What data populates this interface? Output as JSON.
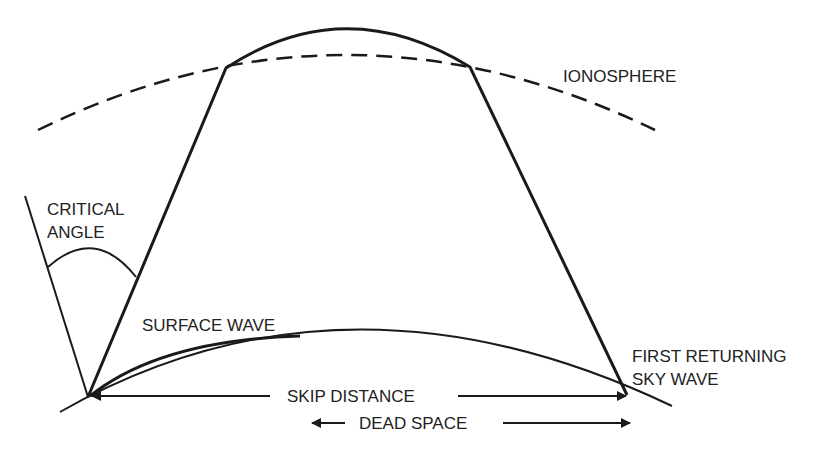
{
  "diagram": {
    "labels": {
      "ionosphere": "IONOSPHERE",
      "critical_angle_1": "CRITICAL",
      "critical_angle_2": "ANGLE",
      "surface_wave": "SURFACE WAVE",
      "first_returning_1": "FIRST RETURNING",
      "first_returning_2": "SKY WAVE",
      "skip_distance": "SKIP DISTANCE",
      "dead_space": "DEAD SPACE"
    },
    "colors": {
      "ink": "#1a1a1a",
      "background": "#ffffff"
    }
  }
}
